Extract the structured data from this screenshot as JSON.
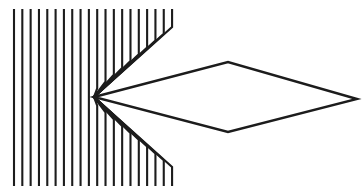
{
  "figure": {
    "background_color": "#ffffff",
    "stroke_color": "#1c1c1c",
    "canvas": {
      "width": 364,
      "height": 193
    },
    "grating": {
      "name": "vertical-line-grating",
      "line_count": 20,
      "first_line_x": 14,
      "spacing": 8.32,
      "top_y": 9,
      "bottom_y": 186,
      "stroke_width": 2.1,
      "bend_gap": 6,
      "description": "Vertical lines that bend inward and converge on a single apex point"
    },
    "apex": {
      "x": 94,
      "y": 97,
      "name": "convergence-apex"
    },
    "diamond": {
      "name": "diamond-shape",
      "stroke_width": 2.4,
      "vertices": [
        {
          "name": "left-vertex",
          "x": 94,
          "y": 97
        },
        {
          "name": "top-vertex",
          "x": 228,
          "y": 62
        },
        {
          "name": "right-vertex",
          "x": 357,
          "y": 99
        },
        {
          "name": "bottom-vertex",
          "x": 228,
          "y": 132
        }
      ]
    }
  }
}
